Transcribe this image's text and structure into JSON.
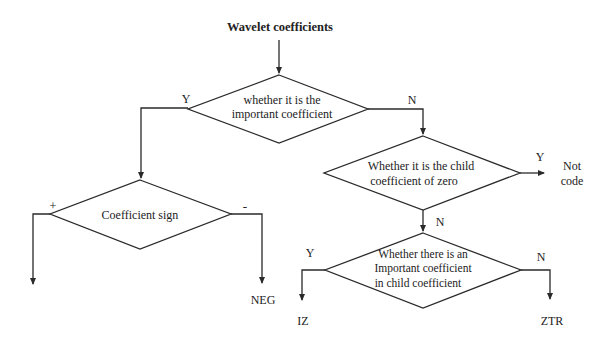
{
  "diagram": {
    "type": "flowchart",
    "start": {
      "label": "Wavelet coefficients"
    },
    "decisions": [
      {
        "id": "d1",
        "lines": [
          "whether it is the",
          "important coefficient"
        ]
      },
      {
        "id": "d2",
        "lines": [
          "Coefficient sign"
        ]
      },
      {
        "id": "d3",
        "lines": [
          "Whether it is the child",
          "coefficient of zero"
        ]
      },
      {
        "id": "d4",
        "lines": [
          "Whether there is an",
          "Important coefficient",
          "in child coefficient"
        ]
      }
    ],
    "edge_labels": {
      "d1_yes": "Y",
      "d1_no": "N",
      "d2_plus": "+",
      "d2_minus": "-",
      "d3_yes": "Y",
      "d3_no": "N",
      "d4_yes": "Y",
      "d4_no": "N"
    },
    "outputs": {
      "neg": "NEG",
      "not_code_line1": "Not",
      "not_code_line2": "code",
      "iz": "IZ",
      "ztr": "ZTR"
    },
    "colors": {
      "line": "#2a2a2a",
      "text": "#222222",
      "background": "#ffffff"
    }
  }
}
